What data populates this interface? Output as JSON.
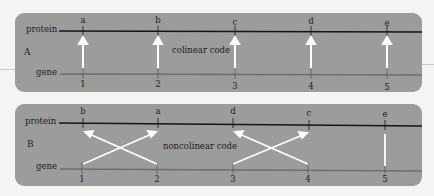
{
  "colors": {
    "panel_bg": "#9c9c9c",
    "protein_line": "#151515",
    "gene_line": "#6e6e6e",
    "arrow": "#ffffff",
    "text": "#1c1c1c"
  },
  "panels": [
    {
      "id": "A",
      "caption": "colinear code",
      "protein_label": "protein",
      "gene_label": "gene",
      "protein_letters": [
        "a",
        "b",
        "c",
        "d",
        "e"
      ],
      "gene_numbers": [
        "1",
        "2",
        "3",
        "4",
        "5"
      ],
      "mapping": [
        [
          "1",
          "a"
        ],
        [
          "2",
          "b"
        ],
        [
          "3",
          "c"
        ],
        [
          "4",
          "d"
        ],
        [
          "5",
          "e"
        ]
      ]
    },
    {
      "id": "B",
      "caption": "noncolinear code",
      "protein_label": "protein",
      "gene_label": "gene",
      "protein_letters": [
        "b",
        "a",
        "d",
        "c",
        "e"
      ],
      "gene_numbers": [
        "1",
        "2",
        "3",
        "4",
        "5"
      ],
      "mapping": [
        [
          "1",
          "a"
        ],
        [
          "2",
          "b"
        ],
        [
          "3",
          "c"
        ],
        [
          "4",
          "d"
        ],
        [
          "5",
          "e"
        ]
      ]
    }
  ]
}
